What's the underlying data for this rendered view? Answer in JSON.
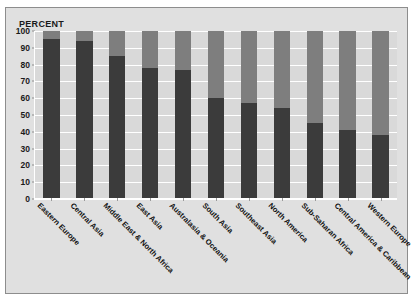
{
  "chart_data": {
    "type": "bar",
    "variant": "stacked-100-percent",
    "title": "",
    "subtitle": "",
    "xlabel": "",
    "ylabel": "PERCENT",
    "ylim": [
      0,
      100
    ],
    "ytick_labels": [
      "100",
      "90",
      "80",
      "70",
      "60",
      "50",
      "40",
      "30",
      "20",
      "10",
      "0"
    ],
    "ytick_values": [
      100,
      90,
      80,
      70,
      60,
      50,
      40,
      30,
      20,
      10,
      0
    ],
    "grid": true,
    "grid_orientation": "horizontal",
    "legend": false,
    "legend_position": "none",
    "categories": [
      "Eastern Europe",
      "Central Asia",
      "Middle East & North Africa",
      "East Asia",
      "Australasia & Oceania",
      "South Asia",
      "Southeast Asia",
      "North America",
      "Sub-Saharan Africa",
      "Central America & Caribbean",
      "Western Europe"
    ],
    "series": [
      {
        "name": "lower-segment",
        "color": "#3b3b3b",
        "values": [
          95,
          94,
          85,
          78,
          77,
          60,
          57,
          54,
          45,
          41,
          38
        ]
      },
      {
        "name": "upper-segment",
        "color": "#7e7e7e",
        "values": [
          5,
          6,
          15,
          22,
          23,
          40,
          43,
          46,
          55,
          59,
          62
        ]
      }
    ],
    "colors": {
      "lower_segment": "#3b3b3b",
      "upper_segment": "#7e7e7e",
      "plot_background": "#d9d9d9",
      "panel_background": "#e0e0e0",
      "gridline": "#ffffff",
      "axis": "#ffffff",
      "text": "#1a1a1a",
      "page_background": "#ffffff"
    }
  }
}
